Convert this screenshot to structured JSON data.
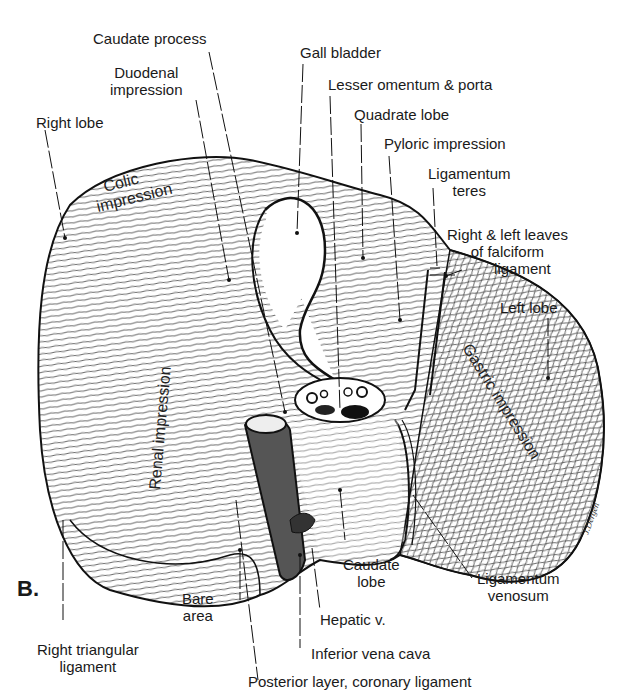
{
  "figure": {
    "panel_label": "B.",
    "signature": "J.Dergen"
  },
  "labels": {
    "caudate_process": "Caudate process",
    "duodenal_impression": [
      "Duodenal",
      "impression"
    ],
    "right_lobe": "Right lobe",
    "gall_bladder": "Gall bladder",
    "lesser_omentum": "Lesser omentum & porta",
    "quadrate_lobe": "Quadrate lobe",
    "pyloric_impression": "Pyloric impression",
    "ligamentum_teres": [
      "Ligamentum",
      "teres"
    ],
    "falciform": [
      "Right & left leaves",
      "of falciform",
      "ligament"
    ],
    "left_lobe": "Left lobe",
    "caudate_lobe": [
      "Caudate",
      "lobe"
    ],
    "ligamentum_venosum": [
      "Ligamentum",
      "venosum"
    ],
    "bare_area": [
      "Bare",
      "area"
    ],
    "hepatic_v": "Hepatic v.",
    "right_triangular": [
      "Right triangular",
      "ligament"
    ],
    "ivc": "Inferior vena cava",
    "posterior_layer": "Posterior layer, coronary ligament"
  },
  "surface_text": {
    "colic": [
      "Colic",
      "impression"
    ],
    "renal": "Renal impression",
    "gastric": "Gastric impression"
  }
}
